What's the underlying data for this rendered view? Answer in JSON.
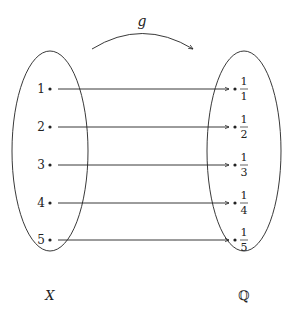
{
  "map_label": "g",
  "domain_set": {
    "label": "X",
    "elements": [
      "1",
      "2",
      "3",
      "4",
      "5"
    ]
  },
  "codomain_set": {
    "label": "ℚ",
    "elements": [
      {
        "num": "1",
        "den": "1"
      },
      {
        "num": "1",
        "den": "2"
      },
      {
        "num": "1",
        "den": "3"
      },
      {
        "num": "1",
        "den": "4"
      },
      {
        "num": "1",
        "den": "5"
      }
    ]
  },
  "colors": {
    "stroke": "#222222",
    "background": "#ffffff"
  }
}
